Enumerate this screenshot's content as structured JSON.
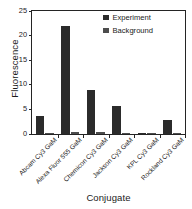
{
  "chart_data": {
    "type": "bar",
    "title": "",
    "xlabel": "Conjugate",
    "ylabel": "Fluorescence",
    "categories": [
      "Abcam Cy3 GaM",
      "Alexa Fluor 555 GaM",
      "Chemicon Cy3 GaM",
      "Jackson Cy3 GaM",
      "KPL Cy3 GaM",
      "Rockland Cy3 GaM"
    ],
    "series": [
      {
        "name": "Experiment",
        "color": "#2b2b2b",
        "values": [
          3.6,
          22.0,
          9.0,
          5.7,
          0.25,
          2.8
        ]
      },
      {
        "name": "Background",
        "color": "#4d4d4d",
        "values": [
          0.3,
          0.5,
          0.35,
          0.25,
          0.3,
          0.3
        ]
      }
    ],
    "ylim": [
      0,
      25
    ],
    "yticks": [
      0,
      5,
      10,
      15,
      20,
      25
    ],
    "ytick_labels": [
      "0",
      "5",
      "10",
      "15",
      "20",
      "25"
    ],
    "grid": false,
    "legend_position": "top-right",
    "xtick_label_rotation": -45
  },
  "legend": {
    "entries": [
      {
        "label": "Experiment",
        "color": "#2b2b2b"
      },
      {
        "label": "Background",
        "color": "#4d4d4d"
      }
    ]
  }
}
